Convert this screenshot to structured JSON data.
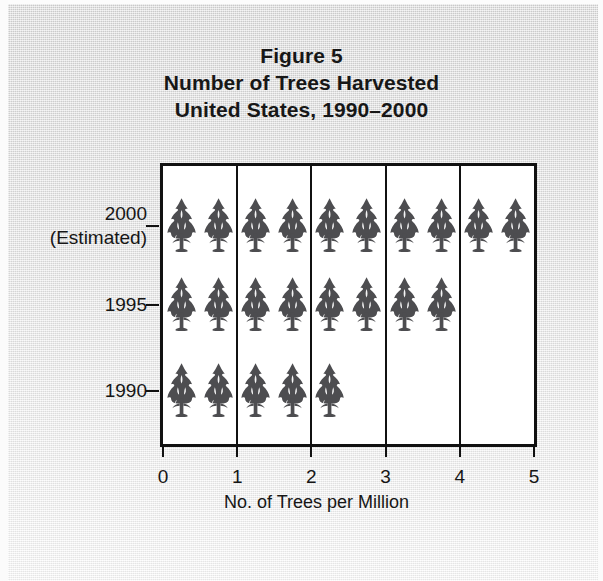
{
  "figure": {
    "title_lines": [
      "Figure 5",
      "Number of Trees Harvested",
      "United States, 1990–2000"
    ],
    "title_line_1": "Figure 5",
    "title_line_2": "Number of Trees Harvested",
    "title_line_3": "United States, 1990–2000"
  },
  "colors": {
    "tree": "#4d4d50",
    "axis": "#111111",
    "plot_background": "#ffffff",
    "text": "#161616",
    "paper": "#e2e2e2"
  },
  "axes": {
    "x_title": "No. of Trees per Million",
    "x_ticks": [
      "0",
      "1",
      "2",
      "3",
      "4",
      "5"
    ],
    "y_categories": [
      {
        "label": "2000",
        "sublabel": "(Estimated)"
      },
      {
        "label": "1995",
        "sublabel": ""
      },
      {
        "label": "1990",
        "sublabel": ""
      }
    ]
  },
  "chart_data": {
    "type": "bar",
    "chart_style": "pictograph",
    "subtitle": "United States, 1990–2000",
    "xlabel": "No. of Trees per Million",
    "ylabel": "",
    "orientation": "horizontal",
    "xlim": [
      0,
      5
    ],
    "xticks": [
      0,
      1,
      2,
      3,
      4,
      5
    ],
    "grid": "vertical gridlines at every integer",
    "legend": "none",
    "icon": "tree",
    "icon_unit_value": 0.5,
    "icon_unit_note": "each tree symbol represents 0.5 trees per million",
    "categories": [
      "2000 (Estimated)",
      "1995",
      "1990"
    ],
    "values": [
      5.0,
      4.0,
      2.5
    ],
    "icon_counts": [
      10,
      8,
      5
    ],
    "series": [
      {
        "name": "No. of Trees per Million",
        "values": [
          5.0,
          4.0,
          2.5
        ]
      }
    ],
    "points": [
      {
        "category": "2000 (Estimated)",
        "value": 5.0,
        "icons": 10
      },
      {
        "category": "1995",
        "value": 4.0,
        "icons": 8
      },
      {
        "category": "1990",
        "value": 2.5,
        "icons": 5
      }
    ]
  }
}
